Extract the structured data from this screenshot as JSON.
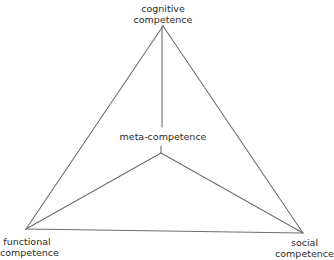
{
  "diagram": {
    "type": "triangle-with-center",
    "line_color": "#6e6e6e",
    "vertices": {
      "top": {
        "x": 163,
        "y": 26,
        "label_lines": [
          "cognitive",
          "competence"
        ]
      },
      "left": {
        "x": 26,
        "y": 229,
        "label_lines": [
          "functional",
          "competence"
        ]
      },
      "right": {
        "x": 303,
        "y": 233,
        "label_lines": [
          "social",
          "competence"
        ]
      }
    },
    "center": {
      "x": 161,
      "y": 153,
      "label": "meta-competence"
    },
    "top_connector_end_y": 127
  }
}
